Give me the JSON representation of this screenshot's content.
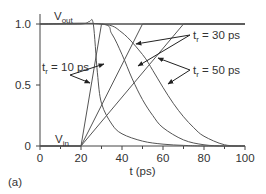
{
  "figure": {
    "panel_label": "(a)"
  },
  "chart_data": {
    "type": "line",
    "title": "",
    "xlabel": "t (ps)",
    "ylabel": "",
    "xlim": [
      0,
      100
    ],
    "ylim": [
      0,
      1.0
    ],
    "x_ticks": [
      0,
      20,
      40,
      60,
      80,
      100
    ],
    "x_minor_ticks": [
      10,
      30,
      50,
      70,
      90
    ],
    "y_ticks": [
      {
        "value": 0,
        "label": "0"
      },
      {
        "value": 0.5,
        "label": "0.5"
      },
      {
        "value": 1.0,
        "label": "1.0"
      }
    ],
    "grid": false,
    "series": [
      {
        "name": "Vin, tr = 10 ps",
        "group": "Vin",
        "x": [
          0,
          20,
          30,
          100
        ],
        "y": [
          0,
          0,
          1.0,
          1.0
        ]
      },
      {
        "name": "Vin, tr = 30 ps",
        "group": "Vin",
        "x": [
          0,
          20,
          50,
          100
        ],
        "y": [
          0,
          0,
          1.0,
          1.0
        ]
      },
      {
        "name": "Vin, tr = 50 ps",
        "group": "Vin",
        "x": [
          0,
          20,
          70,
          100
        ],
        "y": [
          0,
          0,
          1.0,
          1.0
        ]
      },
      {
        "name": "Vout, tr = 10 ps",
        "group": "Vout",
        "x": [
          0,
          20,
          24,
          26,
          28,
          30,
          35,
          40,
          50,
          60,
          70,
          80,
          100
        ],
        "y": [
          1.0,
          1.0,
          1.02,
          1.0,
          0.6,
          0.35,
          0.18,
          0.1,
          0.04,
          0.015,
          0.005,
          0.0,
          0.0
        ]
      },
      {
        "name": "Vout, tr = 30 ps",
        "group": "Vout",
        "x": [
          0,
          30,
          35,
          40,
          45,
          50,
          55,
          60,
          70,
          80,
          90,
          100
        ],
        "y": [
          1.0,
          1.0,
          0.92,
          0.75,
          0.55,
          0.38,
          0.25,
          0.15,
          0.05,
          0.01,
          0.0,
          0.0
        ]
      },
      {
        "name": "Vout, tr = 50 ps",
        "group": "Vout",
        "x": [
          0,
          30,
          40,
          50,
          55,
          60,
          65,
          70,
          75,
          80,
          90,
          100
        ],
        "y": [
          1.0,
          1.0,
          0.93,
          0.75,
          0.62,
          0.48,
          0.35,
          0.24,
          0.15,
          0.08,
          0.01,
          0.0
        ]
      }
    ],
    "annotations": [
      {
        "text": "Vout",
        "main": "V",
        "sub": "out",
        "x": 10,
        "y": 1.05
      },
      {
        "text": "Vin",
        "main": "V",
        "sub": "in",
        "x": 10,
        "y": 0.05
      },
      {
        "text": "tr = 10 ps",
        "main": "t",
        "sub": "r",
        "rest": " = 10 ps",
        "arrows_to": [
          "Vin tr=10",
          "Vout tr=10"
        ]
      },
      {
        "text": "tr = 30 ps",
        "main": "t",
        "sub": "r",
        "rest": " = 30 ps",
        "arrows_to": [
          "Vin tr=30",
          "Vout tr=30"
        ]
      },
      {
        "text": "tr = 50 ps",
        "main": "t",
        "sub": "r",
        "rest": " = 50 ps",
        "arrows_to": [
          "Vin tr=50",
          "Vout tr=50"
        ]
      }
    ],
    "legend": null
  }
}
